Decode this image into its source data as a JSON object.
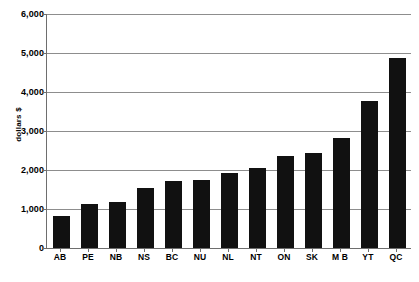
{
  "chart_data": {
    "type": "bar",
    "title": "",
    "xlabel": "",
    "ylabel": "dollars $",
    "ylim": [
      0,
      6000
    ],
    "yticks": [
      "0",
      "1,000",
      "2,000",
      "3,000",
      "4,000",
      "5,000",
      "6,000"
    ],
    "ytick_values": [
      0,
      1000,
      2000,
      3000,
      4000,
      5000,
      6000
    ],
    "grid": true,
    "legend": "none",
    "bar_color": "#111111",
    "categories": [
      "AB",
      "PE",
      "NB",
      "NS",
      "BC",
      "NU",
      "NL",
      "NT",
      "ON",
      "SK",
      "M B",
      "YT",
      "QC"
    ],
    "values": [
      820,
      1140,
      1180,
      1530,
      1730,
      1740,
      1920,
      2050,
      2360,
      2440,
      2810,
      3770,
      4870
    ]
  },
  "figure": {
    "clipped_title": "",
    "axis_color": "#6e6e6e",
    "gridline_color": "#8d8d8d",
    "background": "#ffffff"
  }
}
